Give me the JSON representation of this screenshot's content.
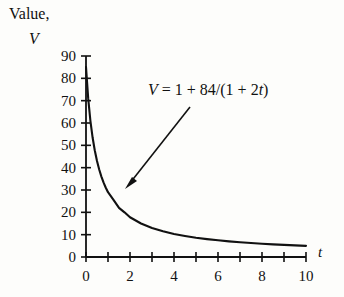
{
  "chart_data": {
    "type": "line",
    "title": "",
    "subtitle": "",
    "xlabel": "t",
    "ylabel": "Value, V",
    "ylabel_line1": "Value,",
    "ylabel_line2": "V",
    "equation": "V = 1 + 84/(1 + 2t)",
    "equation_parts": {
      "lhs": "V",
      "eq": "=",
      "rhs_a": "1 + 84/(1 + 2",
      "rhs_var": "t",
      "rhs_close": ")"
    },
    "xlim": [
      0,
      10
    ],
    "ylim": [
      0,
      90
    ],
    "grid": false,
    "legend": "none",
    "x_ticks_major": [
      0,
      2,
      4,
      6,
      8,
      10
    ],
    "x_ticks_all": [
      0,
      1,
      2,
      3,
      4,
      5,
      6,
      7,
      8,
      9,
      10
    ],
    "x_tick_labels": [
      "0",
      "2",
      "4",
      "6",
      "8",
      "10"
    ],
    "y_ticks": [
      0,
      10,
      20,
      30,
      40,
      50,
      60,
      70,
      80,
      90
    ],
    "y_tick_labels": [
      "0",
      "10",
      "20",
      "30",
      "40",
      "50",
      "60",
      "70",
      "80",
      "90"
    ],
    "series": [
      {
        "name": "V = 1 + 84/(1 + 2t)",
        "x": [
          0,
          0.1,
          0.2,
          0.3,
          0.4,
          0.5,
          0.6,
          0.7,
          0.8,
          0.9,
          1,
          1.25,
          1.5,
          1.75,
          2,
          2.5,
          3,
          3.5,
          4,
          4.5,
          5,
          5.5,
          6,
          6.5,
          7,
          7.5,
          8,
          8.5,
          9,
          9.5,
          10
        ],
        "y": [
          85,
          71,
          61,
          53.5,
          47.7,
          43,
          39.2,
          36,
          33.3,
          31,
          29,
          25.6,
          22,
          20,
          17.8,
          15,
          13,
          11.5,
          10.3,
          9.4,
          8.6,
          8,
          7.5,
          7,
          6.6,
          6.25,
          5.94,
          5.67,
          5.42,
          5.2,
          5
        ]
      }
    ],
    "annotations": [
      {
        "type": "arrow",
        "text": "V = 1 + 84/(1 + 2t)",
        "points_to_x": 1.5,
        "points_to_y": 28
      }
    ]
  },
  "colors": {
    "background": "#fdfdfb",
    "axis": "#111111",
    "curve": "#111111",
    "text": "#111111"
  }
}
